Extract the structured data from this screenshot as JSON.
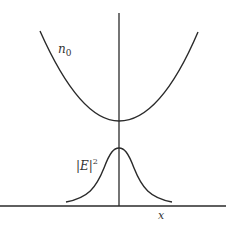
{
  "diagram": {
    "labels": {
      "index_profile": "n",
      "index_sub": "0",
      "field_intensity": "|E|",
      "field_sup": "2",
      "x_axis": "x"
    },
    "curves": [
      {
        "name": "refractive-index-profile",
        "shape": "parabola",
        "vertex": [
          119,
          121
        ],
        "left_end": [
          40,
          31
        ],
        "right_end": [
          198,
          32
        ]
      },
      {
        "name": "field-intensity",
        "shape": "gaussian",
        "peak": [
          119,
          148
        ],
        "left_tail": [
          66,
          202
        ],
        "right_tail": [
          172,
          202
        ]
      }
    ],
    "colors": {
      "line": "#2a2a2a",
      "text": "#333333"
    }
  }
}
